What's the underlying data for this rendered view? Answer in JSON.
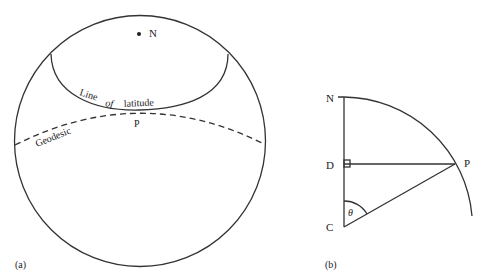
{
  "panel_a": {
    "caption": "(a)",
    "pole_label": "N",
    "latitude_label_parts": [
      "Line",
      "of",
      "latitude"
    ],
    "geodesic_label": "Geodesic",
    "point_label": "P"
  },
  "panel_b": {
    "caption": "(b)",
    "labels": {
      "north": "N",
      "foot": "D",
      "center": "C",
      "point": "P",
      "angle": "θ"
    }
  },
  "colors": {
    "line": "#333333",
    "text": "#222222",
    "background": "#ffffff"
  }
}
